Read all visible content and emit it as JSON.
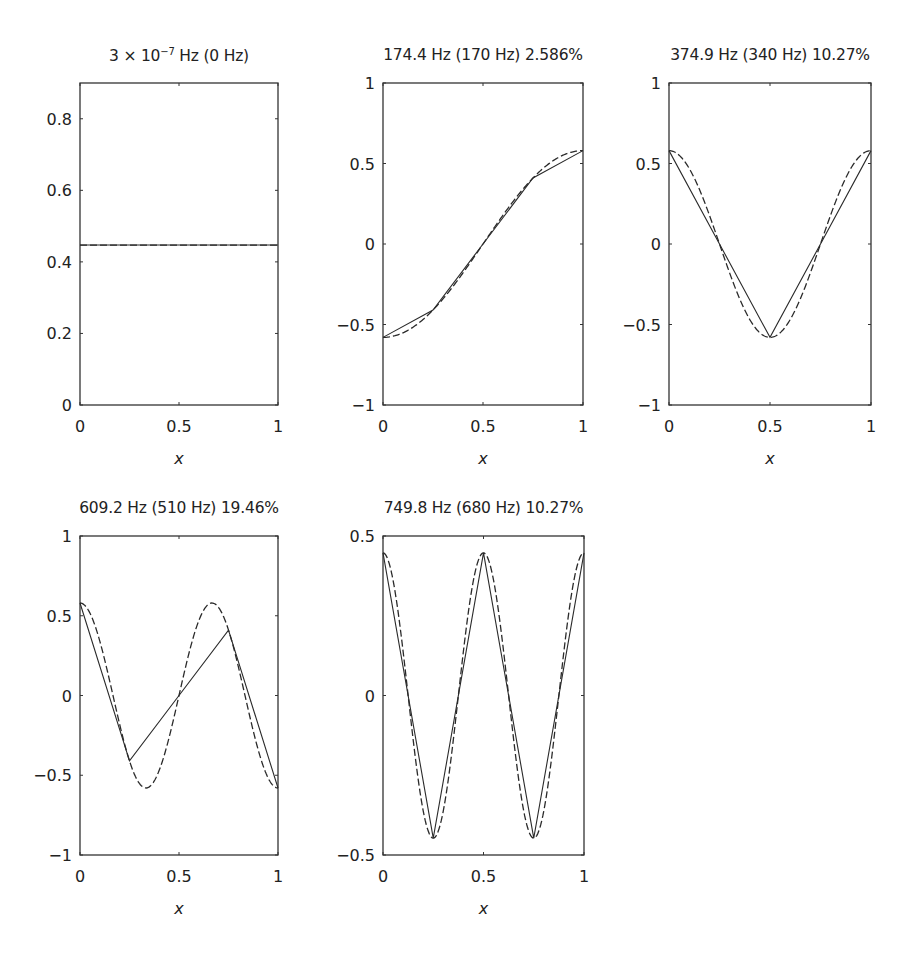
{
  "chart_data": [
    {
      "id": "mode1",
      "type": "line",
      "title": "3 × 10⁻⁷ Hz (0 Hz)",
      "title_parts": {
        "pre": "3 × 10",
        "sup": "−7",
        "post": " Hz (0 Hz)"
      },
      "xlabel": "x",
      "ylabel": "",
      "xlim": [
        0,
        1
      ],
      "ylim": [
        0,
        0.9
      ],
      "xticks": [
        0,
        0.5,
        1
      ],
      "xtick_labels": [
        "0",
        "0.5",
        "1"
      ],
      "yticks": [
        0,
        0.2,
        0.4,
        0.6,
        0.8
      ],
      "ytick_labels": [
        "0",
        "0.2",
        "0.4",
        "0.6",
        "0.8"
      ],
      "grid": false,
      "series": [
        {
          "name": "finite element (solid)",
          "style": "solid",
          "x": [
            0,
            0.25,
            0.5,
            0.75,
            1
          ],
          "y": [
            0.447,
            0.447,
            0.447,
            0.447,
            0.447
          ]
        },
        {
          "name": "exact (dashed)",
          "style": "dashed",
          "func": "const",
          "amp": 0.447,
          "k": 0
        }
      ]
    },
    {
      "id": "mode2",
      "type": "line",
      "title": "174.4 Hz (170 Hz) 2.586%",
      "title_parts": {
        "pre": "174.4 Hz (170 Hz) 2.586%",
        "sup": "",
        "post": ""
      },
      "xlabel": "x",
      "ylabel": "",
      "xlim": [
        0,
        1
      ],
      "ylim": [
        -1,
        1
      ],
      "xticks": [
        0,
        0.5,
        1
      ],
      "xtick_labels": [
        "0",
        "0.5",
        "1"
      ],
      "yticks": [
        -1,
        -0.5,
        0,
        0.5,
        1
      ],
      "ytick_labels": [
        "−1",
        "−0.5",
        "0",
        "0.5",
        "1"
      ],
      "grid": false,
      "series": [
        {
          "name": "finite element (solid)",
          "style": "solid",
          "x": [
            0,
            0.25,
            0.5,
            0.75,
            1
          ],
          "y": [
            -0.58,
            -0.41,
            0,
            0.41,
            0.58
          ]
        },
        {
          "name": "exact (dashed)",
          "style": "dashed",
          "func": "cos",
          "amp": -0.58,
          "k": 1
        }
      ]
    },
    {
      "id": "mode3",
      "type": "line",
      "title": "374.9 Hz (340 Hz) 10.27%",
      "title_parts": {
        "pre": "374.9 Hz (340 Hz) 10.27%",
        "sup": "",
        "post": ""
      },
      "xlabel": "x",
      "ylabel": "",
      "xlim": [
        0,
        1
      ],
      "ylim": [
        -1,
        1
      ],
      "xticks": [
        0,
        0.5,
        1
      ],
      "xtick_labels": [
        "0",
        "0.5",
        "1"
      ],
      "yticks": [
        -1,
        -0.5,
        0,
        0.5,
        1
      ],
      "ytick_labels": [
        "−1",
        "−0.5",
        "0",
        "0.5",
        "1"
      ],
      "grid": false,
      "series": [
        {
          "name": "finite element (solid)",
          "style": "solid",
          "x": [
            0,
            0.25,
            0.5,
            0.75,
            1
          ],
          "y": [
            0.58,
            0,
            -0.58,
            0,
            0.58
          ]
        },
        {
          "name": "exact (dashed)",
          "style": "dashed",
          "func": "cos",
          "amp": 0.58,
          "k": 2
        }
      ]
    },
    {
      "id": "mode4",
      "type": "line",
      "title": "609.2 Hz (510 Hz) 19.46%",
      "title_parts": {
        "pre": "609.2 Hz (510 Hz) 19.46%",
        "sup": "",
        "post": ""
      },
      "xlabel": "x",
      "ylabel": "",
      "xlim": [
        0,
        1
      ],
      "ylim": [
        -1,
        1
      ],
      "xticks": [
        0,
        0.5,
        1
      ],
      "xtick_labels": [
        "0",
        "0.5",
        "1"
      ],
      "yticks": [
        -1,
        -0.5,
        0,
        0.5,
        1
      ],
      "ytick_labels": [
        "−1",
        "−0.5",
        "0",
        "0.5",
        "1"
      ],
      "grid": false,
      "series": [
        {
          "name": "finite element (solid)",
          "style": "solid",
          "x": [
            0,
            0.25,
            0.5,
            0.75,
            1
          ],
          "y": [
            0.58,
            -0.41,
            0,
            0.41,
            -0.58
          ]
        },
        {
          "name": "exact (dashed)",
          "style": "dashed",
          "func": "cos",
          "amp": 0.58,
          "k": 3
        }
      ]
    },
    {
      "id": "mode5",
      "type": "line",
      "title": "749.8 Hz (680 Hz) 10.27%",
      "title_parts": {
        "pre": "749.8 Hz (680 Hz) 10.27%",
        "sup": "",
        "post": ""
      },
      "xlabel": "x",
      "ylabel": "",
      "xlim": [
        0,
        1
      ],
      "ylim": [
        -0.5,
        0.5
      ],
      "xticks": [
        0,
        0.5,
        1
      ],
      "xtick_labels": [
        "0",
        "0.5",
        "1"
      ],
      "yticks": [
        -0.5,
        0,
        0.5
      ],
      "ytick_labels": [
        "−0.5",
        "0",
        "0.5"
      ],
      "grid": false,
      "series": [
        {
          "name": "finite element (solid)",
          "style": "solid",
          "x": [
            0,
            0.25,
            0.5,
            0.75,
            1
          ],
          "y": [
            0.447,
            -0.447,
            0.447,
            -0.447,
            0.447
          ]
        },
        {
          "name": "exact (dashed)",
          "style": "dashed",
          "func": "cos",
          "amp": 0.447,
          "k": 4
        }
      ]
    }
  ],
  "layout": {
    "axes_boxes": [
      {
        "left": 80,
        "top": 83,
        "right": 278,
        "bottom": 405
      },
      {
        "left": 383,
        "top": 83,
        "right": 583,
        "bottom": 405
      },
      {
        "left": 669,
        "top": 83,
        "right": 871,
        "bottom": 405
      },
      {
        "left": 80,
        "top": 536,
        "right": 278,
        "bottom": 855
      },
      {
        "left": 383,
        "top": 536,
        "right": 584,
        "bottom": 855
      }
    ],
    "line_color": "#2a2a2a",
    "axis_color": "#333333"
  }
}
